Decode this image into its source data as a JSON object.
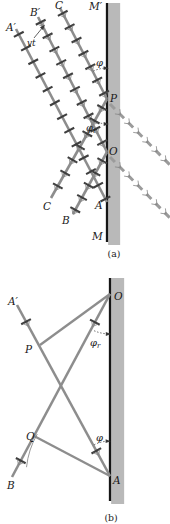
{
  "diagram": {
    "description_visible_text_only": true,
    "colors": {
      "wall": "#161616",
      "band": "#b9b9b9",
      "ray": "#8d8d8d",
      "tick": "#3e3e3e",
      "chev": "#858585",
      "dash": "#9b9b9b",
      "thin": "#3a3a3a",
      "arc": "#7d7d7d",
      "text": "#1a1a1a"
    },
    "panels": [
      {
        "id": "a",
        "caption": "(a)",
        "caption_pos": [
          114,
          257
        ],
        "wall": {
          "x": 107,
          "top": 3,
          "bottom": 242,
          "band_top": 3,
          "band_bottom": 245,
          "band_w": 12,
          "line_w": 2.3
        },
        "rays": [
          {
            "name": "incident-ray-A",
            "p1": [
              16,
              29
            ],
            "p2": [
              107,
              202
            ],
            "style": "solid",
            "tick_spacing": 15.5,
            "tick_offset": 6,
            "chevrons": false
          },
          {
            "name": "incident-ray-B",
            "p1": [
              38,
              17
            ],
            "p2": [
              107,
              152
            ],
            "style": "solid",
            "tick_spacing": 15,
            "tick_offset": 6,
            "chevrons": true
          },
          {
            "name": "incident-ray-C",
            "p1": [
              60,
              8
            ],
            "p2": [
              107,
              99
            ],
            "style": "solid",
            "tick_spacing": 15,
            "tick_offset": 6,
            "chevrons": true
          },
          {
            "name": "reflected-ray-from-P",
            "p1": [
              107,
              99
            ],
            "p2": [
              51,
              198
            ],
            "style": "solid",
            "tick_spacing": 15,
            "tick_offset": 10,
            "chevrons": true
          },
          {
            "name": "reflected-ray-from-O",
            "p1": [
              107,
              152
            ],
            "p2": [
              73,
              214
            ],
            "style": "solid",
            "tick_spacing": 14,
            "tick_offset": 10,
            "chevrons": true
          },
          {
            "name": "virtual-ray-from-P",
            "p1": [
              110,
              104
            ],
            "p2": [
              170,
              165
            ],
            "style": "dashed",
            "chevrons": true
          },
          {
            "name": "virtual-ray-from-O",
            "p1": [
              110,
              157
            ],
            "p2": [
              170,
              218
            ],
            "style": "dashed",
            "chevrons": true
          }
        ],
        "arcs": [
          {
            "name": "angle-phi-arc",
            "cx": 107,
            "cy": 99,
            "r": 31,
            "a1": 244,
            "a2": 266,
            "dotted": true,
            "arrow": [
              105.8,
              68.2
            ]
          },
          {
            "name": "angle-phi-r-arc",
            "cx": 107,
            "cy": 99,
            "r": 25,
            "a1": 94,
            "a2": 119,
            "dotted": true,
            "arrow": [
              105.9,
              124
            ]
          }
        ],
        "arrows": [
          {
            "name": "vt-arrow",
            "from": [
              34,
              38
            ],
            "to": [
              43,
              27
            ]
          }
        ],
        "labels": [
          {
            "name": "label-A-prime",
            "text": "A′",
            "x": 6,
            "y": 31
          },
          {
            "name": "label-B-prime",
            "text": "B′",
            "x": 30,
            "y": 16
          },
          {
            "name": "label-C-top",
            "text": "C",
            "x": 55,
            "y": 9
          },
          {
            "name": "label-M-prime",
            "text": "M′",
            "x": 89,
            "y": 10
          },
          {
            "name": "label-vt",
            "text": "vt",
            "x": 27,
            "y": 46,
            "size": 9
          },
          {
            "name": "label-phi",
            "text": "φ",
            "x": 96,
            "y": 66,
            "size": 10
          },
          {
            "name": "label-P",
            "text": "P",
            "x": 110,
            "y": 102
          },
          {
            "name": "label-phi-r",
            "text": "φ",
            "sub": "r",
            "x": 86,
            "y": 131,
            "size": 10
          },
          {
            "name": "label-O",
            "text": "O",
            "x": 109,
            "y": 155
          },
          {
            "name": "label-A-wall",
            "text": "A",
            "x": 95,
            "y": 209
          },
          {
            "name": "label-C-bottom",
            "text": "C",
            "x": 43,
            "y": 210
          },
          {
            "name": "label-B-bottom",
            "text": "B",
            "x": 62,
            "y": 224
          },
          {
            "name": "label-M",
            "text": "M",
            "x": 92,
            "y": 240
          }
        ]
      },
      {
        "id": "b",
        "caption": "(b)",
        "caption_pos": [
          111,
          521
        ],
        "wall": {
          "x": 110,
          "top": 278,
          "bottom": 501,
          "band_top": 278,
          "band_bottom": 504,
          "band_w": 13,
          "line_w": 2.3
        },
        "rays": [
          {
            "name": "incident-ray-A-prime-A",
            "p1": [
              17,
              305
            ],
            "p2": [
              110,
              476
            ],
            "style": "solid",
            "tick_at": [
              19,
              166
            ],
            "chevrons": true
          },
          {
            "name": "reflected-ray-O-B",
            "p1": [
              110,
              294
            ],
            "p2": [
              12,
              477
            ],
            "style": "solid",
            "tick_at": [
              32,
              189
            ],
            "chevrons": true
          },
          {
            "name": "wavefront-P-O",
            "p1": [
              40,
              345
            ],
            "p2": [
              110,
              294
            ],
            "style": "solid",
            "w": 2.3
          },
          {
            "name": "wavefront-Q-A",
            "p1": [
              34,
              436
            ],
            "p2": [
              110,
              476
            ],
            "style": "solid",
            "w": 2.3
          }
        ],
        "arcs": [
          {
            "name": "angle-phi-r-arc-b",
            "cx": 110,
            "cy": 294,
            "r": 40,
            "a1": 93,
            "a2": 115,
            "dotted": true,
            "arrow": [
              108,
              334
            ]
          },
          {
            "name": "angle-phi-arc-b",
            "cx": 110,
            "cy": 476,
            "r": 35,
            "a1": 243,
            "a2": 266,
            "dotted": true,
            "arrow": [
              107.8,
              441.2
            ]
          },
          {
            "name": "wavelet-construction-arc",
            "cx": 110,
            "cy": 476,
            "r": 84,
            "a1": 186,
            "a2": 210,
            "dotted": false
          }
        ],
        "arrows": [],
        "labels": [
          {
            "name": "label-A-prime-b",
            "text": "A′",
            "x": 8,
            "y": 305
          },
          {
            "name": "label-O-b",
            "text": "O",
            "x": 114,
            "y": 300
          },
          {
            "name": "label-P-b",
            "text": "P",
            "x": 25,
            "y": 353
          },
          {
            "name": "label-phi-r-b",
            "text": "φ",
            "sub": "r",
            "x": 90,
            "y": 346,
            "size": 10
          },
          {
            "name": "label-Q-b",
            "text": "Q",
            "x": 26,
            "y": 440
          },
          {
            "name": "label-phi-b",
            "text": "φ",
            "x": 96,
            "y": 441,
            "size": 10
          },
          {
            "name": "label-B-b",
            "text": "B",
            "x": 7,
            "y": 489
          },
          {
            "name": "label-A-b",
            "text": "A",
            "x": 113,
            "y": 484
          }
        ]
      }
    ]
  }
}
